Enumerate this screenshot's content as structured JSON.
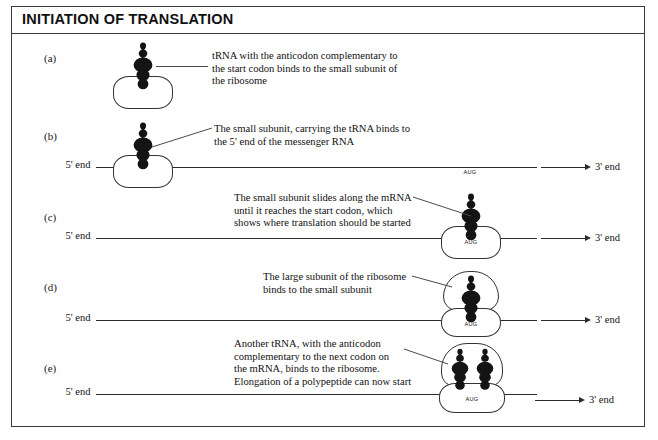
{
  "figure": {
    "title": "INITIATION OF TRANSLATION",
    "three_prime_label": "3' end",
    "five_prime_label": "5'\nend",
    "codon": "AUG"
  },
  "panels": [
    {
      "letter": "(a)",
      "caption": "tRNA with the anticodon complementary to\nthe start codon binds to the small subunit of\nthe ribosome",
      "has_mrna": false,
      "has_large_subunit": false,
      "trna_count": 1,
      "codon_visible": false
    },
    {
      "letter": "(b)",
      "caption": "The small subunit, carrying the tRNA binds to\nthe 5' end of the messenger RNA",
      "has_mrna": true,
      "has_large_subunit": false,
      "trna_count": 1,
      "codon_visible": true
    },
    {
      "letter": "(c)",
      "caption": "The small subunit slides along the mRNA\nuntil it reaches the start codon, which\nshows where translation should be started",
      "has_mrna": true,
      "has_large_subunit": false,
      "trna_count": 1,
      "codon_visible": true
    },
    {
      "letter": "(d)",
      "caption": "The large subunit of the ribosome\nbinds to the small subunit",
      "has_mrna": true,
      "has_large_subunit": true,
      "trna_count": 1,
      "codon_visible": true
    },
    {
      "letter": "(e)",
      "caption": "Another tRNA, with the anticodon\ncomplementary to the next codon on\nthe mRNA, binds to the ribosome.\nElongation of a polypeptide can now start",
      "has_mrna": true,
      "has_large_subunit": true,
      "trna_count": 2,
      "codon_visible": true
    }
  ],
  "colors": {
    "ink": "#111111",
    "frame": "#3a3a3a",
    "trna_fill": "#141414",
    "line": "#2b2b2b"
  }
}
